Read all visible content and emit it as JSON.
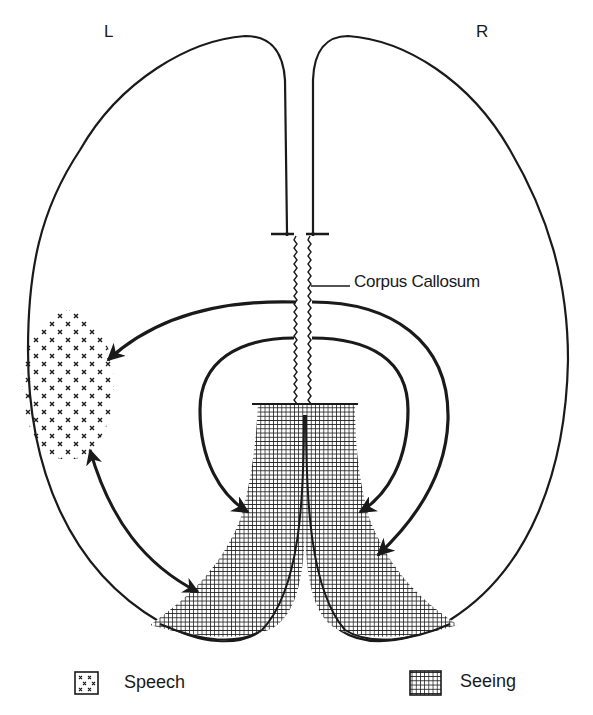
{
  "diagram": {
    "title_hemispheres": {
      "left": "L",
      "right": "R"
    },
    "labels": {
      "corpus_callosum": "Corpus Callosum"
    },
    "regions": [
      {
        "id": "speech",
        "pattern": "x-dots",
        "hemisphere": "left"
      },
      {
        "id": "seeing",
        "pattern": "grid",
        "hemisphere": "both"
      }
    ],
    "arrows": [
      {
        "from": "right-hemisphere-via-corpus-callosum",
        "to": "speech-area",
        "type": "single"
      },
      {
        "from": "speech-area",
        "to": "left-seeing-area",
        "type": "double"
      },
      {
        "from": "corpus-callosum-inner-left",
        "to": "left-seeing-area",
        "type": "single"
      },
      {
        "from": "corpus-callosum-inner-right",
        "to": "right-seeing-area",
        "type": "single"
      },
      {
        "from": "corpus-callosum-outer-right",
        "to": "right-seeing-area",
        "type": "single"
      }
    ],
    "colors": {
      "ink": "#1a1a1a",
      "background": "#ffffff"
    }
  },
  "legend": {
    "items": [
      {
        "label": "Speech",
        "pattern": "x-dots"
      },
      {
        "label": "Seeing",
        "pattern": "grid"
      }
    ]
  }
}
